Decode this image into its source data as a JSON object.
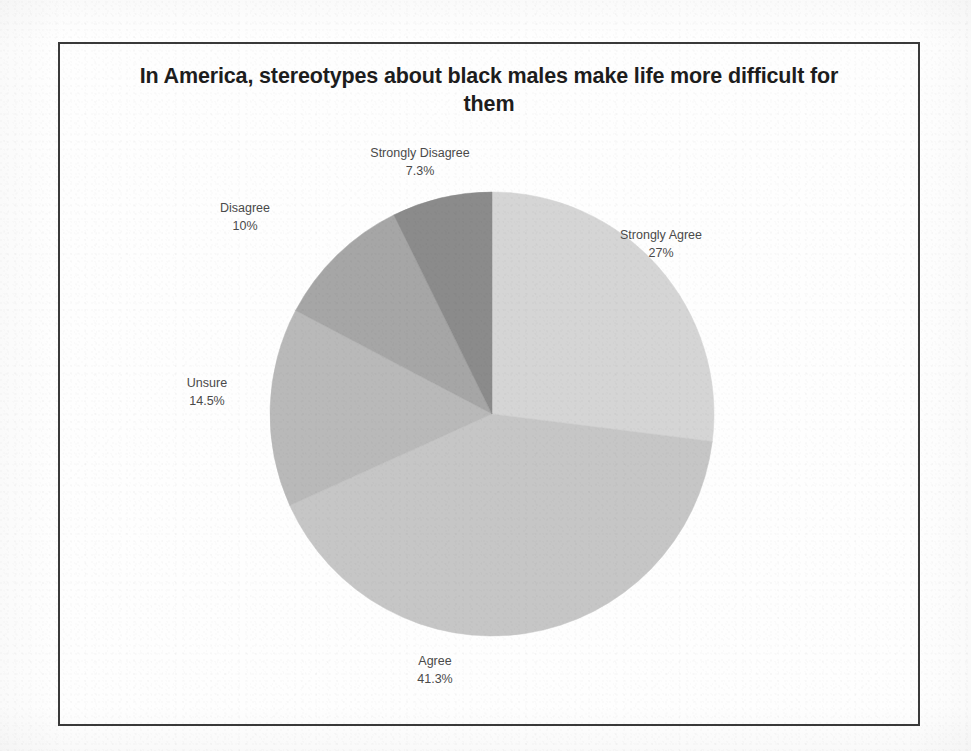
{
  "chart": {
    "title": "In America, stereotypes about black males make life more difficult for them"
  },
  "chart_data": {
    "type": "pie",
    "title": "In America, stereotypes about black males make life more difficult for them",
    "xlabel": "",
    "ylabel": "",
    "legend_position": "none",
    "labels_position": "outside",
    "grid": false,
    "start_angle_deg": 0,
    "direction": "clockwise",
    "categories": [
      "Strongly Agree",
      "Agree",
      "Unsure",
      "Disagree",
      "Strongly Disagree"
    ],
    "values": [
      27,
      41.3,
      14.5,
      10,
      7.3
    ],
    "value_labels": [
      "27%",
      "41.3%",
      "14.5%",
      "10%",
      "7.3%"
    ],
    "colors": [
      "#d5d5d5",
      "#c6c6c6",
      "#b9b9b9",
      "#a6a6a6",
      "#8b8b8b"
    ],
    "slices": [
      {
        "label": "Strongly Agree",
        "value": 27,
        "value_label": "27%",
        "color": "#d5d5d5"
      },
      {
        "label": "Agree",
        "value": 41.3,
        "value_label": "41.3%",
        "color": "#c6c6c6"
      },
      {
        "label": "Unsure",
        "value": 14.5,
        "value_label": "14.5%",
        "color": "#b9b9b9"
      },
      {
        "label": "Disagree",
        "value": 10,
        "value_label": "10%",
        "color": "#a6a6a6"
      },
      {
        "label": "Strongly Disagree",
        "value": 7.3,
        "value_label": "7.3%",
        "color": "#8b8b8b"
      }
    ]
  },
  "colors": {
    "frame_border": "#3a3a3a",
    "title_text": "#1d1d1d",
    "label_text": "#4a4a4a",
    "background": "#ffffff"
  }
}
